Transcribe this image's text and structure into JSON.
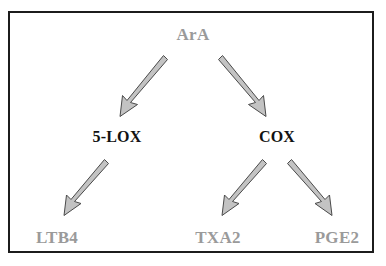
{
  "diagram": {
    "border_color": "#1c1c1c",
    "background_color": "#ffffff",
    "nodes": {
      "source": {
        "label": "ArA",
        "role": "substrate",
        "color": "#9a9a9a"
      },
      "enzyme_left": {
        "label": "5-LOX",
        "role": "enzyme",
        "color": "#121212"
      },
      "enzyme_right": {
        "label": "COX",
        "role": "enzyme",
        "color": "#121212"
      },
      "product_left": {
        "label": "LTB4",
        "role": "product",
        "color": "#9a9a9a"
      },
      "product_middle": {
        "label": "TXA2",
        "role": "product",
        "color": "#9a9a9a"
      },
      "product_right": {
        "label": "PGE2",
        "role": "product",
        "color": "#9a9a9a"
      }
    },
    "arrows": [
      {
        "name": "ara-to-5lox",
        "from": "ArA",
        "to": "5-LOX",
        "direction": "down-left",
        "fill": "#c3c3c3",
        "outline": "#4a4a4a"
      },
      {
        "name": "ara-to-cox",
        "from": "ArA",
        "to": "COX",
        "direction": "down-right",
        "fill": "#c3c3c3",
        "outline": "#4a4a4a"
      },
      {
        "name": "5lox-to-ltb4",
        "from": "5-LOX",
        "to": "LTB4",
        "direction": "down-left",
        "fill": "#c3c3c3",
        "outline": "#4a4a4a"
      },
      {
        "name": "cox-to-txa2",
        "from": "COX",
        "to": "TXA2",
        "direction": "down-left",
        "fill": "#c3c3c3",
        "outline": "#4a4a4a"
      },
      {
        "name": "cox-to-pge2",
        "from": "COX",
        "to": "PGE2",
        "direction": "down-right",
        "fill": "#c3c3c3",
        "outline": "#4a4a4a"
      }
    ]
  }
}
